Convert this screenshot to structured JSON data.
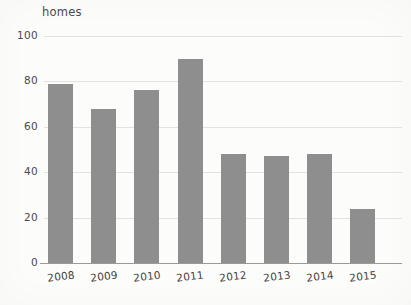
{
  "chart_data": {
    "type": "bar",
    "title": "",
    "subtitle": "",
    "xlabel": "",
    "ylabel": "homes",
    "categories": [
      "2008",
      "2009",
      "2010",
      "2011",
      "2012",
      "2013",
      "2014",
      "2015"
    ],
    "values": [
      79,
      68,
      76,
      90,
      48,
      47,
      48,
      24
    ],
    "ylim": [
      0,
      100
    ],
    "ytick_labels": [
      "100",
      "80",
      "60",
      "40",
      "20",
      "0"
    ],
    "ytick_values": [
      100,
      80,
      60,
      40,
      20,
      0
    ],
    "grid": true,
    "grid_axis": "y",
    "legend": false,
    "legend_position": "none",
    "series_name": "homes",
    "bar_color": "#8e8e8e",
    "grid_color": "#e2e2e0",
    "axis_color": "#9a9a98",
    "background_color": "#fcfcfb",
    "text_color": "#4a4a4a"
  }
}
